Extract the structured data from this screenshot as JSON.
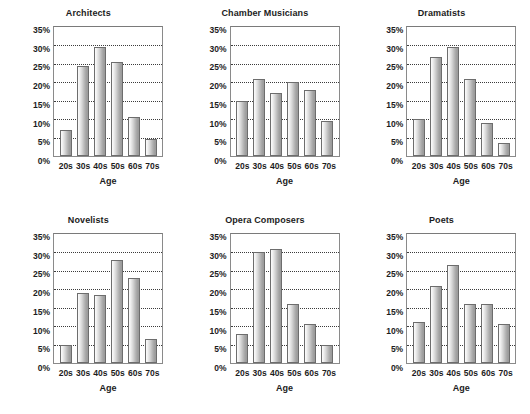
{
  "chart_data": {
    "type": "bar",
    "title": "",
    "layout": {
      "rows": 2,
      "cols": 3,
      "grid": true,
      "legend": false
    },
    "xlabel": "Age",
    "ylabel": "",
    "categories": [
      "20s",
      "30s",
      "40s",
      "50s",
      "60s",
      "70s"
    ],
    "ylim": [
      0,
      35
    ],
    "ytick_values": [
      0,
      5,
      10,
      15,
      20,
      25,
      30,
      35
    ],
    "ytick_labels": [
      "0%",
      "5%",
      "10%",
      "15%",
      "20%",
      "25%",
      "30%",
      "35%"
    ],
    "bar_color": "#c6c6c6",
    "bar_edge_color": "#6d6d6d",
    "grid_color": "#3c3c3c",
    "panels": [
      {
        "title": "Architects",
        "xlabel": "Age",
        "values": [
          7,
          24.5,
          29.5,
          25.5,
          10.5,
          4.5
        ]
      },
      {
        "title": "Chamber Musicians",
        "xlabel": "Age",
        "values": [
          15,
          21,
          17,
          20,
          18,
          9.5
        ]
      },
      {
        "title": "Dramatists",
        "xlabel": "Age",
        "values": [
          10,
          27,
          29.5,
          21,
          9,
          3.5
        ]
      },
      {
        "title": "Novelists",
        "xlabel": "Age",
        "values": [
          5,
          19,
          18.5,
          28,
          23,
          6.5
        ]
      },
      {
        "title": "Opera Composers",
        "xlabel": "Age",
        "values": [
          8,
          30,
          31,
          16,
          10.5,
          5
        ]
      },
      {
        "title": "Poets",
        "xlabel": "Age",
        "values": [
          11,
          21,
          26.5,
          16,
          16,
          10.5
        ]
      }
    ]
  }
}
